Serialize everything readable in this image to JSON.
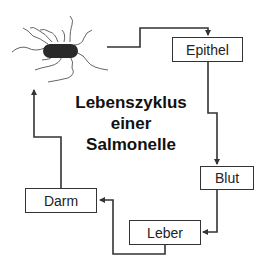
{
  "title": {
    "line1": "Lebenszyklus",
    "line2": "einer",
    "line3": "Salmonelle"
  },
  "stages": [
    {
      "id": "epithel",
      "label": "Epithel"
    },
    {
      "id": "blut",
      "label": "Blut"
    },
    {
      "id": "leber",
      "label": "Leber"
    },
    {
      "id": "darm",
      "label": "Darm"
    }
  ],
  "icons": {
    "bacterium": "salmonella-bacterium-icon"
  },
  "colors": {
    "line": "#333333",
    "bacterium_body": "#2a2a2a",
    "background": "#ffffff"
  }
}
